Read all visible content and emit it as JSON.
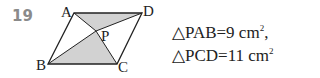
{
  "problem_number": "19",
  "points": {
    "A": "A",
    "B": "B",
    "C": "C",
    "D": "D",
    "P": "P"
  },
  "given": [
    {
      "triangle": "△PAB",
      "value": "=9 cm",
      "exp": "2",
      "suffix": ","
    },
    {
      "triangle": "△PCD",
      "value": "=11 cm",
      "exp": "2",
      "suffix": ""
    }
  ],
  "colors": {
    "shade": "#d2d2d2",
    "line": "#222222",
    "number": "#8a8a8a"
  }
}
